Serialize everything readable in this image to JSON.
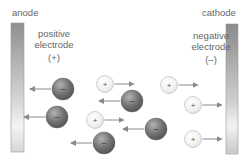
{
  "diagram": {
    "anode": {
      "title": "anode",
      "desc_line1": "positive",
      "desc_line2": "electrode",
      "sign": "(+)"
    },
    "cathode": {
      "title": "cathode",
      "desc_line1": "negative",
      "desc_line2": "electrode",
      "sign": "(–)"
    },
    "ion_symbols": {
      "positive": "+",
      "negative": "–"
    },
    "colors": {
      "electrode_dark": "#8f8f8f",
      "electrode_light": "#ececec",
      "negative_ion": "#6e6e6e",
      "positive_ion": "#f2f2f2",
      "arrow": "#8a8a8a"
    },
    "negative_ions": [
      {
        "x": 63,
        "y": 89,
        "direction": "left"
      },
      {
        "x": 57,
        "y": 117,
        "direction": "left"
      },
      {
        "x": 132,
        "y": 101,
        "direction": "left"
      },
      {
        "x": 156,
        "y": 129,
        "direction": "left"
      },
      {
        "x": 104,
        "y": 143,
        "direction": "left"
      }
    ],
    "positive_ions": [
      {
        "x": 105,
        "y": 84,
        "direction": "right"
      },
      {
        "x": 169,
        "y": 85,
        "direction": "right"
      },
      {
        "x": 95,
        "y": 120,
        "direction": "right"
      },
      {
        "x": 193,
        "y": 105,
        "direction": "right"
      },
      {
        "x": 193,
        "y": 139,
        "direction": "right"
      }
    ]
  }
}
